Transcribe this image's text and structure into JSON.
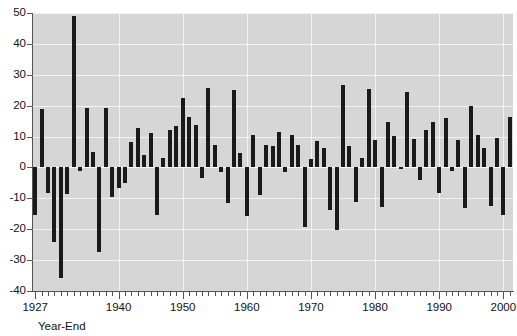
{
  "chart_data": {
    "type": "bar",
    "title": "",
    "subtitle": "",
    "xlabel": "Year-End",
    "ylabel": "",
    "ylim": [
      -40,
      50
    ],
    "xlim": [
      1926.5,
      2001.5
    ],
    "grid": true,
    "legend": null,
    "y_ticks": [
      50,
      40,
      30,
      20,
      10,
      0,
      -10,
      -20,
      -30,
      -40
    ],
    "y_tick_labels": [
      "50",
      "40",
      "30",
      "20",
      "10",
      "0",
      "-10",
      "-20",
      "-30",
      "-40"
    ],
    "x_ticks": [
      1927,
      1940,
      1950,
      1960,
      1970,
      1980,
      1990,
      2000
    ],
    "x_tick_labels": [
      "1927",
      "1940",
      "1950",
      "1960",
      "1970",
      "1980",
      "1990",
      "2000"
    ],
    "x_minor_tick_interval": 1,
    "bar_color": "#1a1a1a",
    "plot_background": "#d6d6d6",
    "gridline_color": "#f2f2f2",
    "categories": [
      1927,
      1928,
      1929,
      1930,
      1931,
      1932,
      1933,
      1934,
      1935,
      1936,
      1937,
      1938,
      1939,
      1940,
      1941,
      1942,
      1943,
      1944,
      1945,
      1946,
      1947,
      1948,
      1949,
      1950,
      1951,
      1952,
      1953,
      1954,
      1955,
      1956,
      1957,
      1958,
      1959,
      1960,
      1961,
      1962,
      1963,
      1964,
      1965,
      1966,
      1967,
      1968,
      1969,
      1970,
      1971,
      1972,
      1973,
      1974,
      1975,
      1976,
      1977,
      1978,
      1979,
      1980,
      1981,
      1982,
      1983,
      1984,
      1985,
      1986,
      1987,
      1988,
      1989,
      1990,
      1991,
      1992,
      1993,
      1994,
      1995,
      1996,
      1997,
      1998,
      1999,
      2000,
      2001
    ],
    "values": [
      -15.3,
      19.0,
      -8.2,
      -24.3,
      -35.8,
      -8.7,
      49.0,
      -1.0,
      19.2,
      4.9,
      -27.5,
      19.2,
      -9.6,
      -6.7,
      -5.0,
      8.3,
      12.7,
      4.0,
      11.1,
      -15.4,
      3.0,
      12.0,
      13.4,
      22.5,
      16.2,
      13.8,
      -3.3,
      25.6,
      7.2,
      -1.4,
      -11.6,
      25.1,
      4.8,
      -15.8,
      10.6,
      -9.0,
      7.2,
      7.0,
      11.4,
      -1.6,
      10.6,
      7.3,
      -19.3,
      2.8,
      8.6,
      6.3,
      -13.8,
      -20.2,
      26.6,
      7.0,
      -11.2,
      3.0,
      25.5,
      9.0,
      -12.9,
      14.7,
      10.1,
      -0.5,
      24.5,
      9.3,
      -4.1,
      12.1,
      14.8,
      -8.3,
      16.1,
      -1.0,
      8.8,
      -13.1,
      20.0,
      10.4,
      6.2,
      -12.5,
      9.5,
      -15.4,
      16.4
    ]
  }
}
